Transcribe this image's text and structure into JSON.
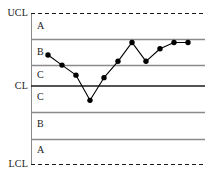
{
  "chart_data": {
    "type": "line",
    "title": "",
    "subtitle": "",
    "xlabel": "",
    "ylabel": "",
    "grid": false,
    "legend_position": "none",
    "x": [
      1,
      2,
      3,
      4,
      5,
      6,
      7,
      8,
      9,
      10,
      11
    ],
    "values": [
      1.35,
      0.95,
      0.55,
      -0.45,
      0.45,
      1.1,
      1.85,
      1.1,
      1.6,
      1.85,
      1.85
    ],
    "series": [
      {
        "name": "measurement",
        "values": [
          1.35,
          0.95,
          0.55,
          -0.45,
          0.45,
          1.1,
          1.85,
          1.1,
          1.6,
          1.85,
          1.85
        ]
      }
    ],
    "ylim": [
      -3,
      3
    ],
    "xlim": [
      0,
      12
    ],
    "control_limits": {
      "ucl_label": "UCL",
      "ucl_value": 3,
      "cl_label": "CL",
      "cl_value": 0,
      "lcl_label": "LCL",
      "lcl_value": -3
    },
    "zone_boundaries": [
      2,
      1,
      -1,
      -2
    ],
    "zones": [
      {
        "label": "A",
        "upper": 3,
        "lower": 2,
        "side": "upper"
      },
      {
        "label": "B",
        "upper": 2,
        "lower": 1,
        "side": "upper"
      },
      {
        "label": "C",
        "upper": 1,
        "lower": 0,
        "side": "upper"
      },
      {
        "label": "C",
        "upper": 0,
        "lower": -1,
        "side": "lower"
      },
      {
        "label": "B",
        "upper": -1,
        "lower": -2,
        "side": "lower"
      },
      {
        "label": "A",
        "upper": -2,
        "lower": -3,
        "side": "lower"
      }
    ],
    "colors": {
      "series_line": "#000000",
      "marker": "#000000",
      "center_line": "#1a1a1a",
      "zone_line": "#808080",
      "control_limit_line": "#1a1a1a",
      "axis": "#808080",
      "background": "#ffffff"
    }
  },
  "labels": {
    "ucl": "UCL",
    "cl": "CL",
    "lcl": "LCL",
    "zone_a_upper": "A",
    "zone_b_upper": "B",
    "zone_c_upper": "C",
    "zone_c_lower": "C",
    "zone_b_lower": "B",
    "zone_a_lower": "A"
  }
}
